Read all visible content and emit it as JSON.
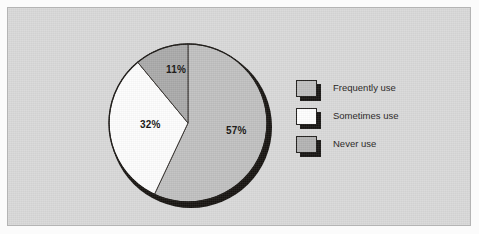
{
  "chart_data": {
    "type": "pie",
    "title": "",
    "categories": [
      "Frequently use",
      "Sometimes use",
      "Never use"
    ],
    "values": [
      57,
      32,
      11
    ],
    "value_labels": [
      "57%",
      "32%",
      "11%"
    ],
    "unit": "percent",
    "start_angle_deg": 0,
    "direction": "clockwise",
    "legend_position": "right",
    "grid": false,
    "slices": [
      {
        "label": "Frequently use",
        "value": 57,
        "value_label": "57%",
        "color": "#c0c0c0",
        "start_deg": 0,
        "end_deg": 205.2,
        "label_x": 124,
        "label_y": 88
      },
      {
        "label": "Sometimes use",
        "value": 32,
        "value_label": "32%",
        "color": "#fdfdfd",
        "start_deg": 205.2,
        "end_deg": 320.4,
        "label_x": 38,
        "label_y": 82
      },
      {
        "label": "Never use",
        "value": 11,
        "value_label": "11%",
        "color": "#a9a9a9",
        "start_deg": 320.4,
        "end_deg": 360,
        "label_x": 64,
        "label_y": 27
      }
    ]
  },
  "legend": {
    "items": [
      {
        "label": "Frequently use",
        "color": "#bfbfbf"
      },
      {
        "label": "Sometimes use",
        "color": "#fefefe"
      },
      {
        "label": "Never use",
        "color": "#b2b2b2"
      }
    ]
  },
  "colors": {
    "page_background": "#fbfbfb",
    "panel_background": "#d8d8d8",
    "panel_border": "#b4b4b4",
    "pie_outline": "#1a1714",
    "pie_shadow": "#15120f",
    "text": "#1d1b19"
  }
}
